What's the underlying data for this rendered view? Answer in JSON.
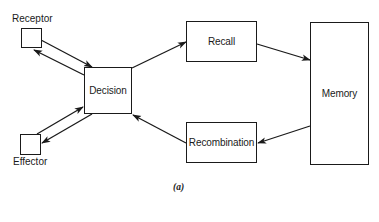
{
  "diagram": {
    "nodes": [
      {
        "id": "receptor",
        "label": "Receptor"
      },
      {
        "id": "decision",
        "label": "Decision"
      },
      {
        "id": "effector",
        "label": "Effector"
      },
      {
        "id": "recall",
        "label": "Recall"
      },
      {
        "id": "memory",
        "label": "Memory"
      },
      {
        "id": "recombination",
        "label": "Recombination"
      }
    ],
    "edges": [
      {
        "from": "receptor",
        "to": "decision"
      },
      {
        "from": "decision",
        "to": "receptor"
      },
      {
        "from": "decision",
        "to": "effector"
      },
      {
        "from": "effector",
        "to": "decision"
      },
      {
        "from": "decision",
        "to": "recall"
      },
      {
        "from": "recall",
        "to": "memory"
      },
      {
        "from": "memory",
        "to": "recombination"
      },
      {
        "from": "recombination",
        "to": "decision"
      }
    ],
    "caption": "(a)",
    "colors": {
      "stroke": "#1a1a1a",
      "background": "#ffffff"
    }
  }
}
